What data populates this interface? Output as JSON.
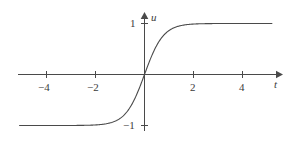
{
  "chart_data": {
    "type": "line",
    "title": "",
    "subtitle": "",
    "xlabel": "t",
    "ylabel": "u",
    "function": "u = tanh(1.3 t)",
    "grid": false,
    "legend": null,
    "xlim": [
      -5.8,
      5.5
    ],
    "ylim": [
      -1.45,
      1.25
    ],
    "xticks": [
      -4,
      -2,
      2,
      4
    ],
    "xtick_labels": [
      "−4",
      "−2",
      "2",
      "4"
    ],
    "yticks": [
      1,
      -1
    ],
    "ytick_labels": [
      "1",
      "−1"
    ],
    "series": [
      {
        "name": "u(t)",
        "color": "#4a4a4a",
        "x": [
          -5.1,
          -4.8,
          -4.5,
          -4.2,
          -3.9,
          -3.6,
          -3.3,
          -3.0,
          -2.7,
          -2.4,
          -2.1,
          -1.8,
          -1.5,
          -1.2,
          -0.9,
          -0.6,
          -0.3,
          0.0,
          0.3,
          0.6,
          0.9,
          1.2,
          1.5,
          1.8,
          2.1,
          2.4,
          2.7,
          3.0,
          3.3,
          3.6,
          3.9,
          4.2,
          4.5,
          4.8,
          5.2
        ],
        "y": [
          -1.0,
          -1.0,
          -1.0,
          -0.999,
          -0.999,
          -0.998,
          -0.997,
          -0.995,
          -0.992,
          -0.987,
          -0.978,
          -0.964,
          -0.94,
          -0.9,
          -0.833,
          -0.729,
          -0.575,
          0.0,
          0.575,
          0.729,
          0.833,
          0.9,
          0.94,
          0.964,
          0.978,
          0.987,
          0.992,
          0.995,
          0.997,
          0.998,
          0.999,
          0.999,
          1.0,
          1.0,
          1.0
        ]
      }
    ]
  },
  "axes": {
    "x_axis_label": "t",
    "y_axis_label": "u",
    "x_tick_1": "−4",
    "x_tick_2": "−2",
    "x_tick_3": "2",
    "x_tick_4": "4",
    "y_tick_pos": "1",
    "y_tick_neg": "−1"
  },
  "colors": {
    "background": "#ffffff",
    "axis": "#4a4a4a",
    "curve": "#4a4a4a",
    "text": "#3b3b3b"
  }
}
